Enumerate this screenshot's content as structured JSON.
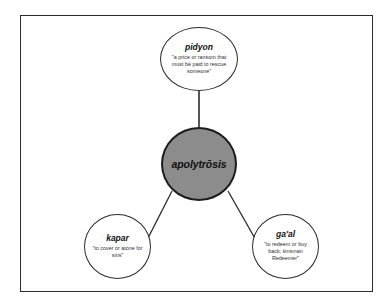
{
  "diagram": {
    "type": "concept-map",
    "background_color": "#ffffff",
    "frame_border_color": "#2b2b2b",
    "center": {
      "id": "apolytrosis",
      "term": "apolytrōsis",
      "fill_color": "#8c8c8c",
      "border_color": "#1c1c1c"
    },
    "nodes": [
      {
        "id": "pidyon",
        "position": "top",
        "term": "pidyon",
        "gloss": "\"a price or ransom that must be paid to rescue someone\"",
        "fill_color": "#ffffff",
        "border_color": "#2b2b2b"
      },
      {
        "id": "kapar",
        "position": "bottom-left",
        "term": "kapar",
        "gloss": "\"to cover or atone for sins\"",
        "fill_color": "#ffffff",
        "border_color": "#2b2b2b"
      },
      {
        "id": "gaal",
        "position": "bottom-right",
        "term": "ga'al",
        "gloss": "\"to redeem or buy back; kinsman Redeemer\"",
        "fill_color": "#ffffff",
        "border_color": "#2b2b2b"
      }
    ],
    "edges": [
      {
        "from": "pidyon",
        "to": "apolytrosis",
        "style": "straight-line"
      },
      {
        "from": "kapar",
        "to": "apolytrosis",
        "style": "straight-line"
      },
      {
        "from": "gaal",
        "to": "apolytrosis",
        "style": "straight-line"
      }
    ]
  }
}
